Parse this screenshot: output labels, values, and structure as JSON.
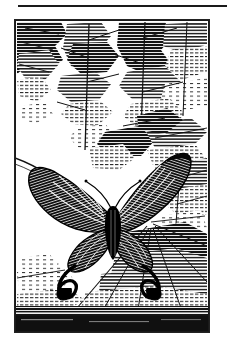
{
  "page": {
    "width": 227,
    "height": 352,
    "background_color": "#ffffff",
    "ink_color": "#1a1a1a"
  },
  "rule": {
    "name": "horizontal-rule",
    "x": 18,
    "y": 5,
    "width": 209,
    "height": 2,
    "color": "#1a1a1a"
  },
  "plate": {
    "x": 14,
    "y": 19,
    "width": 194,
    "height": 312,
    "border_color": "#222222",
    "medium": "wood engraving",
    "palette": [
      "#000000",
      "#ffffff"
    ],
    "caption": "",
    "title": "",
    "subject": "swallowtail butterfly among foliage"
  },
  "illustration": {
    "style": "black and white line engraving with horizontal hatching",
    "background": {
      "name": "foliage-background",
      "description": "dense fern and palm fronds rendered in horizontal hatch strokes",
      "regions": [
        {
          "name": "upper-canopy",
          "note": "branching fronds filling upper two thirds"
        },
        {
          "name": "lower-right-fronds",
          "note": "radiating palm leaves at lower right"
        },
        {
          "name": "ground-band",
          "note": "solid dark hatched band along bottom edge"
        }
      ]
    },
    "butterfly": {
      "name": "butterfly",
      "position": {
        "cx": 110,
        "cy": 215
      },
      "forewings": 2,
      "hindwing_tails": 2,
      "wing_pattern": "dark wings with light radial striations",
      "body": "dark thorax and abdomen with antennae"
    },
    "branch": {
      "name": "curved-branch",
      "note": "thin curved stem sweeping from left edge toward butterfly"
    }
  }
}
